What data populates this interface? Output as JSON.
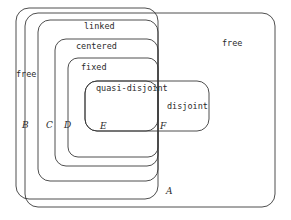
{
  "diagram": {
    "stroke_color": "#3a3a3a",
    "background_color": "#ffffff",
    "regions": [
      {
        "id": "free-outer",
        "name": "free",
        "letter": "",
        "label": "free",
        "shape": "rounded-rectangle"
      },
      {
        "id": "free-inner",
        "name": "free",
        "letter": "A",
        "label": "free",
        "shape": "rounded-rectangle"
      },
      {
        "id": "linked",
        "name": "linked",
        "letter": "B",
        "label": "linked",
        "shape": "rounded-rectangle"
      },
      {
        "id": "centered",
        "name": "centered",
        "letter": "C",
        "label": "centered",
        "shape": "rounded-rectangle"
      },
      {
        "id": "fixed",
        "name": "fixed",
        "letter": "D",
        "label": "fixed",
        "shape": "rounded-rectangle"
      },
      {
        "id": "quasi-disjoint",
        "name": "quasi-disjoint",
        "letter": "E",
        "label": "quasi-disjoint",
        "shape": "rounded-rectangle"
      },
      {
        "id": "disjoint",
        "name": "disjoint",
        "letter": "F",
        "label": "disjoint",
        "shape": "rounded-rectangle"
      }
    ],
    "labels": {
      "free_outer": "free",
      "free_inner": "free",
      "linked": "linked",
      "centered": "centered",
      "fixed": "fixed",
      "quasi_disjoint": "quasi-disjoint",
      "disjoint": "disjoint"
    },
    "letters": {
      "A": "A",
      "B": "B",
      "C": "C",
      "D": "D",
      "E": "E",
      "F": "F"
    }
  }
}
